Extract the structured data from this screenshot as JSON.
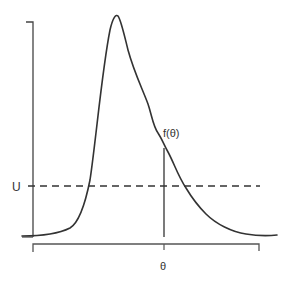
{
  "diagram": {
    "labels": {
      "u_label": "U",
      "f_theta_label": "f(θ)",
      "theta_label": "θ"
    },
    "colors": {
      "stroke": "#333333",
      "background": "#ffffff"
    },
    "elements": {
      "y_axis": {
        "x": 33,
        "y_top": 22,
        "y_bottom": 237
      },
      "x_axis_bracket": {
        "y": 244,
        "x_left": 33,
        "x_right": 259
      },
      "threshold_line": {
        "y": 186,
        "x_start": 35,
        "x_end": 260,
        "style": "dashed"
      },
      "theta_marker": {
        "x": 164,
        "y_top": 148,
        "y_bottom": 237
      },
      "curve_peak": {
        "x": 116,
        "y": 16
      }
    }
  }
}
